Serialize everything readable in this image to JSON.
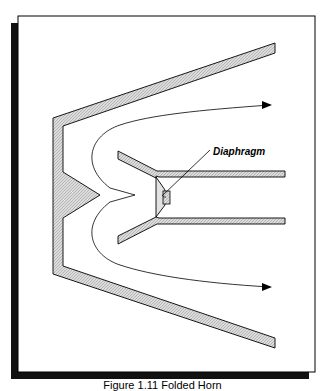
{
  "figure": {
    "label_diaphragm": "Diaphragm",
    "caption": "Figure 1.11 Folded Horn",
    "colors": {
      "frame_border": "#000000",
      "frame_shadow": "#111111",
      "hatch_fill": "#d4d4d4",
      "outline": "#000000",
      "background": "#ffffff"
    },
    "elements": [
      "outer-horn-wall",
      "back-wall-wedge",
      "inner-horn-arm-upper",
      "inner-horn-arm-lower",
      "driver-diaphragm",
      "sound-path-curve",
      "arrow-upper",
      "arrow-lower"
    ]
  }
}
